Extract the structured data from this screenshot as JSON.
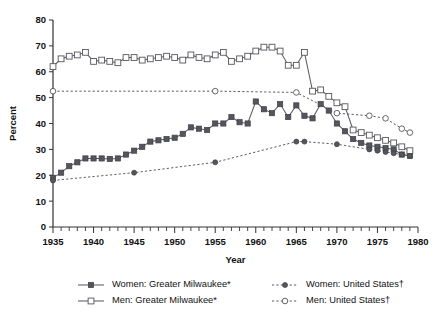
{
  "chart_data": {
    "type": "line",
    "title": "",
    "xlabel": "Year",
    "ylabel": "Percent",
    "xlim": [
      1935,
      1980
    ],
    "ylim": [
      0,
      80
    ],
    "yticks": [
      0,
      10,
      20,
      30,
      40,
      50,
      60,
      70,
      80
    ],
    "xticks": [
      1935,
      1940,
      1945,
      1950,
      1955,
      1960,
      1965,
      1970,
      1975,
      1980
    ],
    "xminor_step": 1,
    "grid": false,
    "legend_position": "bottom",
    "series": [
      {
        "name": "Women: Greater Milwaukee*",
        "marker": "filled-square",
        "line": "solid",
        "x": [
          1935,
          1936,
          1937,
          1938,
          1939,
          1940,
          1941,
          1942,
          1943,
          1944,
          1945,
          1946,
          1947,
          1948,
          1949,
          1950,
          1951,
          1952,
          1953,
          1954,
          1955,
          1956,
          1957,
          1958,
          1959,
          1960,
          1961,
          1962,
          1963,
          1964,
          1965,
          1966,
          1967,
          1968,
          1969,
          1970,
          1971,
          1972,
          1973,
          1974,
          1975,
          1976,
          1977,
          1978,
          1979
        ],
        "values": [
          19.0,
          21.0,
          23.5,
          25.0,
          26.5,
          26.5,
          26.5,
          26.3,
          26.5,
          28.0,
          29.5,
          31.0,
          33.0,
          33.5,
          34.0,
          34.5,
          36.0,
          38.5,
          38.0,
          37.5,
          40.0,
          40.0,
          42.5,
          40.5,
          40.0,
          48.5,
          45.5,
          44.0,
          47.5,
          42.5,
          47.0,
          43.0,
          42.0,
          47.5,
          45.0,
          40.0,
          37.0,
          34.0,
          32.5,
          31.5,
          31.0,
          30.5,
          30.0,
          28.0,
          27.5
        ]
      },
      {
        "name": "Men: Greater Milwaukee*",
        "marker": "open-square",
        "line": "solid",
        "x": [
          1935,
          1936,
          1937,
          1938,
          1939,
          1940,
          1941,
          1942,
          1943,
          1944,
          1945,
          1946,
          1947,
          1948,
          1949,
          1950,
          1951,
          1952,
          1953,
          1954,
          1955,
          1956,
          1957,
          1958,
          1959,
          1960,
          1961,
          1962,
          1963,
          1964,
          1965,
          1966,
          1967,
          1968,
          1969,
          1970,
          1971,
          1972,
          1973,
          1974,
          1975,
          1976,
          1977,
          1978,
          1979
        ],
        "values": [
          62.0,
          65.0,
          66.0,
          66.5,
          67.5,
          64.0,
          64.5,
          64.0,
          63.5,
          65.5,
          65.5,
          64.5,
          65.0,
          65.5,
          66.0,
          65.5,
          64.5,
          66.5,
          65.5,
          65.0,
          66.5,
          67.5,
          64.0,
          65.0,
          66.0,
          68.0,
          69.5,
          69.5,
          68.0,
          62.5,
          62.5,
          67.5,
          52.5,
          53.0,
          50.5,
          48.0,
          46.5,
          37.5,
          36.5,
          35.5,
          34.5,
          33.5,
          32.5,
          31.0,
          29.5
        ]
      },
      {
        "name": "Women: United States†",
        "marker": "filled-circle",
        "line": "dashed",
        "x": [
          1935,
          1945,
          1955,
          1965,
          1966,
          1970,
          1974,
          1975,
          1976,
          1977,
          1978,
          1979
        ],
        "values": [
          18.0,
          21.0,
          25.0,
          33.0,
          33.0,
          32.0,
          30.0,
          29.5,
          29.0,
          28.5,
          28.0,
          27.5
        ]
      },
      {
        "name": "Men: United States†",
        "marker": "open-circle",
        "line": "dashed",
        "x": [
          1935,
          1955,
          1965,
          1970,
          1974,
          1976,
          1978,
          1979
        ],
        "values": [
          52.5,
          52.5,
          52.0,
          44.0,
          43.0,
          42.0,
          38.0,
          36.5
        ]
      }
    ],
    "legend": [
      {
        "label": "Women: Greater Milwaukee*",
        "marker": "filled-square",
        "line": "solid"
      },
      {
        "label": "Women: United States†",
        "marker": "filled-circle",
        "line": "dashed"
      },
      {
        "label": "Men: Greater Milwaukee*",
        "marker": "open-square",
        "line": "solid"
      },
      {
        "label": "Men: United States†",
        "marker": "open-circle",
        "line": "dashed"
      }
    ],
    "colors": {
      "ink": "#55555d",
      "axis": "#333333"
    }
  }
}
